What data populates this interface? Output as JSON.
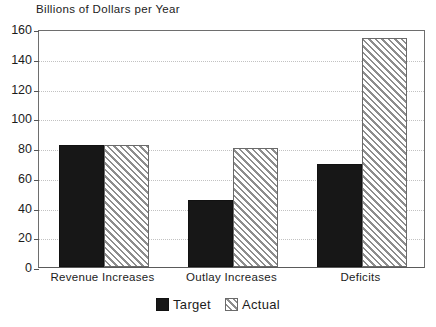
{
  "chart_data": {
    "type": "bar",
    "title": "Billions of Dollars per Year",
    "subtitle": "",
    "xlabel": "",
    "ylabel": "",
    "categories": [
      "Revenue Increases",
      "Outlay Increases",
      "Deficits"
    ],
    "series": [
      {
        "name": "Target",
        "values": [
          82,
          45,
          69
        ],
        "fill": "solid-black",
        "color": "#171717"
      },
      {
        "name": "Actual",
        "values": [
          82,
          80,
          154
        ],
        "fill": "diagonal-hatch",
        "color": "#8d8d8d"
      }
    ],
    "ylim": [
      0,
      160
    ],
    "ytick_values": [
      0,
      20,
      40,
      60,
      80,
      100,
      120,
      140,
      160
    ],
    "ytick_labels": [
      "0",
      "20",
      "40",
      "60",
      "80",
      "100",
      "120",
      "140",
      "160"
    ],
    "grid": true,
    "grid_style": "dotted",
    "grid_color": "#c2c2c2",
    "legend_position": "bottom-center",
    "legend_entries": [
      "Target",
      "Actual"
    ],
    "annotations": [],
    "frame_color": "#6e6e6e",
    "background": "#ffffff"
  },
  "legend": {
    "target_label": "Target",
    "actual_label": "Actual"
  }
}
